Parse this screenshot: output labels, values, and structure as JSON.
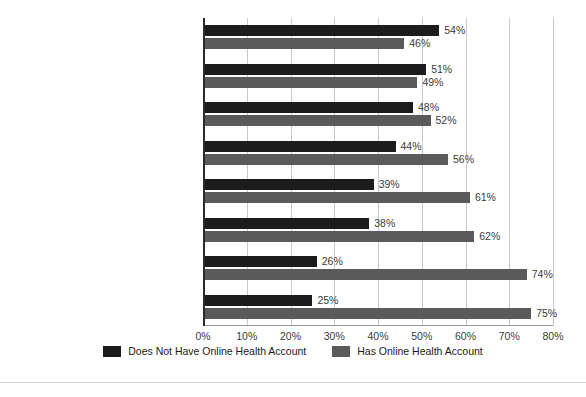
{
  "chart_data": {
    "type": "bar",
    "orientation": "horizontal",
    "title": "",
    "subtitle": "",
    "xlabel": "",
    "ylabel": "",
    "xlim": [
      0,
      80
    ],
    "xtick_step": 10,
    "grid": true,
    "legend_position": "bottom",
    "value_suffix": "%",
    "categories": [
      "Live chat with insurance agent",
      "Online patient communities",
      "Company e-newsletter",
      "Live chat with health coach",
      "Online lifestyle information",
      "Online forums",
      "Online rating tool for care providers",
      "Health wiki"
    ],
    "tick_labels": [
      "0%",
      "10%",
      "20%",
      "30%",
      "40%",
      "50%",
      "60%",
      "70%",
      "80%"
    ],
    "series": [
      {
        "name": "Does Not Have Online Health Account",
        "color": "#1c1c1c",
        "values": [
          54,
          51,
          48,
          44,
          39,
          38,
          26,
          25
        ],
        "value_labels": [
          "54%",
          "51%",
          "48%",
          "44%",
          "39%",
          "38%",
          "26%",
          "25%"
        ]
      },
      {
        "name": "Has Online Health Account",
        "color": "#5a5a5a",
        "values": [
          46,
          49,
          52,
          56,
          61,
          62,
          74,
          75
        ],
        "value_labels": [
          "46%",
          "49%",
          "52%",
          "56%",
          "61%",
          "62%",
          "74%",
          "75%"
        ]
      }
    ]
  }
}
